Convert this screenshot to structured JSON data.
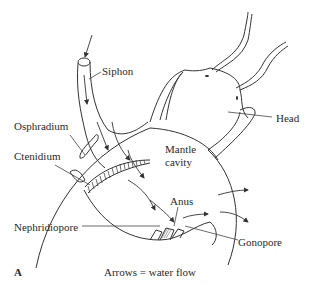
{
  "figure": {
    "panel_letter": "A",
    "caption": "Arrows = water flow",
    "labels": {
      "siphon": "Siphon",
      "head": "Head",
      "osphradium": "Osphradium",
      "ctenidium": "Ctenidium",
      "mantle_cavity_line1": "Mantle",
      "mantle_cavity_line2": "cavity",
      "anus": "Anus",
      "nephridiopore": "Nephridiopore",
      "gonopore": "Gonopore"
    },
    "colors": {
      "line": "#333333",
      "background": "#ffffff"
    }
  }
}
